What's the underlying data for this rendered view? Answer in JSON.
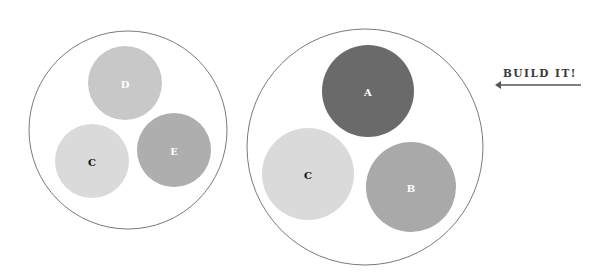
{
  "diagram": {
    "groups": [
      {
        "id": "left-group",
        "outline_color": "#777777",
        "nodes": [
          {
            "label": "D",
            "fill": "#c8c8c8",
            "text_color": "#ffffff"
          },
          {
            "label": "C",
            "fill": "#dadada",
            "text_color": "#111111"
          },
          {
            "label": "E",
            "fill": "#aeaeae",
            "text_color": "#ffffff"
          }
        ]
      },
      {
        "id": "right-group",
        "outline_color": "#777777",
        "nodes": [
          {
            "label": "A",
            "fill": "#6a6a6a",
            "text_color": "#ffffff"
          },
          {
            "label": "C",
            "fill": "#dadada",
            "text_color": "#111111"
          },
          {
            "label": "B",
            "fill": "#a9a9a9",
            "text_color": "#ffffff"
          }
        ]
      }
    ],
    "annotation": {
      "text": "BUILD IT!",
      "arrow": "arrow-left",
      "color": "#444444"
    }
  }
}
